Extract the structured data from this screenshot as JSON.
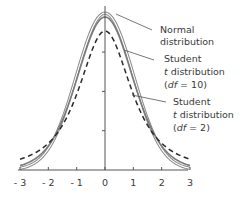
{
  "chart_data": {
    "type": "line",
    "title": "",
    "xlabel": "",
    "ylabel": "",
    "xlim": [
      -3,
      3
    ],
    "ylim": [
      0,
      0.4
    ],
    "x_ticks": [
      -3,
      -2,
      -1,
      0,
      1,
      2,
      3
    ],
    "x_tick_labels": [
      "-3",
      "-2",
      "-1",
      "0",
      "1",
      "2",
      "3"
    ],
    "y_ticks": [
      0.1,
      0.2,
      0.3
    ],
    "y_tick_labels": [],
    "grid": false,
    "legend": "annotations with leader lines, right side",
    "series": [
      {
        "name": "Normal distribution",
        "style": "double gray outline line",
        "function": "normal pdf",
        "peak": 0.399
      },
      {
        "name": "Student t distribution (df=10)",
        "style": "solid gray line",
        "function": "student t pdf",
        "df": 10,
        "peak": 0.389
      },
      {
        "name": "Student t distribution (df=2)",
        "style": "dashed dark line",
        "function": "student t pdf",
        "df": 2,
        "peak": 0.354
      }
    ],
    "annotations": [
      {
        "lines": [
          "Normal",
          "distribution"
        ],
        "points_to": "Normal distribution"
      },
      {
        "lines": [
          "Student",
          "t distribution",
          "(df=10)"
        ],
        "points_to": "Student t distribution (df=10)"
      },
      {
        "lines": [
          "Student",
          "t distribution",
          "(df=2)"
        ],
        "points_to": "Student t distribution (df=2)"
      }
    ]
  },
  "labels": {
    "normal_l1": "Normal",
    "normal_l2": "distribution",
    "t10_l1": "Student",
    "t10_l2_italic": "t",
    "t10_l2_rest": " distribution",
    "t10_l3_open": "(",
    "t10_l3_italic": "df",
    "t10_l3_rest": " = 10)",
    "t2_l1": "Student",
    "t2_l2_italic": "t",
    "t2_l2_rest": " distribution",
    "t2_l3_open": "(",
    "t2_l3_italic": "df",
    "t2_l3_rest": " = 2)"
  },
  "colors": {
    "normal": "#8a8a8a",
    "t10": "#7a7a7a",
    "t2": "#2a2a2a",
    "axis": "#555555",
    "text": "#3a3a3a"
  }
}
